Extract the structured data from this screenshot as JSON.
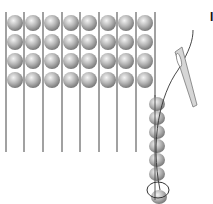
{
  "figure": {
    "label": "I",
    "grid": {
      "columns": 8,
      "rows": 4
    },
    "strand": {
      "beads": 7
    },
    "colors": {
      "bead": "#b8b8b8",
      "thread": "#777777",
      "needle": "#999999"
    }
  }
}
